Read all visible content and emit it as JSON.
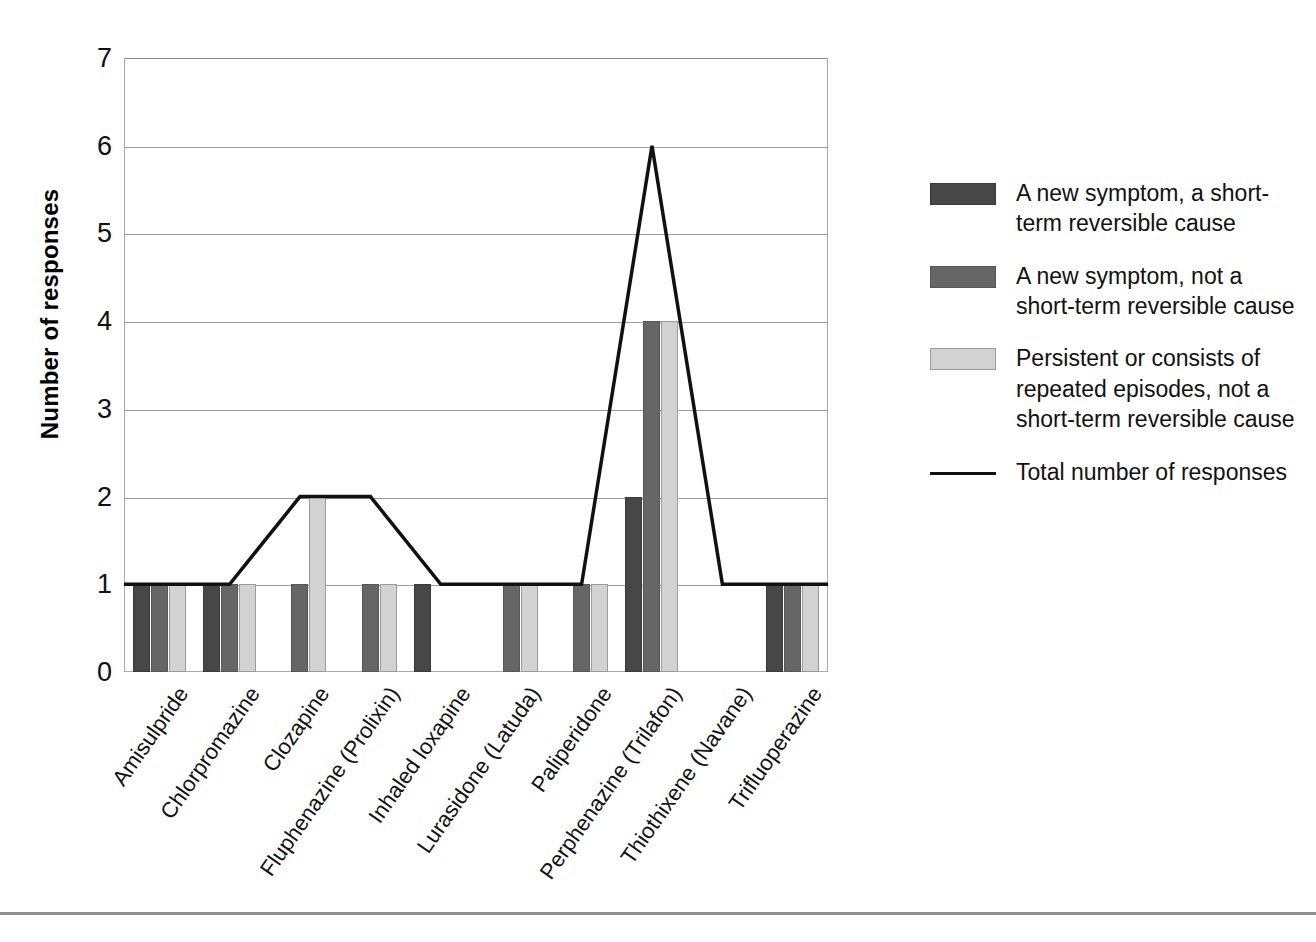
{
  "chart_data": {
    "type": "bar",
    "title": "",
    "xlabel": "",
    "ylabel": "Number of responses",
    "ylim": [
      0,
      7
    ],
    "yticks": [
      0,
      1,
      2,
      3,
      4,
      5,
      6,
      7
    ],
    "grid": true,
    "legend_position": "right",
    "categories": [
      "Amisulpride",
      "Chlorpromazine",
      "Clozapine",
      "Fluphenazine (Prolixin)",
      "Inhaled loxapine",
      "Lurasidone (Latuda)",
      "Paliperidone",
      "Perphenazine (Trilafon)",
      "Thiothixene (Navane)",
      "Trifluoperazine"
    ],
    "series": [
      {
        "name": "A new symptom, a short-term reversible cause",
        "type": "bar",
        "color": "#474747",
        "values": [
          1,
          1,
          0,
          0,
          1,
          0,
          0,
          2,
          0,
          1
        ]
      },
      {
        "name": "A new symptom, not a short-term reversible cause",
        "type": "bar",
        "color": "#666666",
        "values": [
          1,
          1,
          1,
          1,
          0,
          1,
          1,
          4,
          0,
          1
        ]
      },
      {
        "name": "Persistent or consists of repeated episodes, not a short-term reversible cause",
        "type": "bar",
        "color": "#d2d2d2",
        "values": [
          1,
          1,
          2,
          1,
          0,
          1,
          1,
          4,
          0,
          1
        ]
      },
      {
        "name": "Total number of responses",
        "type": "line",
        "color": "#111111",
        "values": [
          1,
          1,
          2,
          2,
          1,
          1,
          1,
          6,
          1,
          1
        ]
      }
    ]
  },
  "axes": {
    "y_title": "Number of responses",
    "y_ticks": [
      "7",
      "6",
      "5",
      "4",
      "3",
      "2",
      "1",
      "0"
    ],
    "x_labels": [
      "Amisulpride",
      "Chlorpromazine",
      "Clozapine",
      "Fluphenazine (Prolixin)",
      "Inhaled loxapine",
      "Lurasidone (Latuda)",
      "Paliperidone",
      "Perphenazine (Trilafon)",
      "Thiothixene (Navane)",
      "Trifluoperazine"
    ]
  },
  "legend": {
    "items": [
      {
        "kind": "swatch",
        "style": "s0",
        "label": "A new symptom, a short-term reversible cause"
      },
      {
        "kind": "swatch",
        "style": "s1",
        "label": "A new symptom, not a short-term reversible cause"
      },
      {
        "kind": "swatch",
        "style": "s2",
        "label": "Persistent or consists of repeated episodes, not a short-term reversible cause"
      },
      {
        "kind": "line",
        "style": "line",
        "label": "Total number of responses"
      }
    ]
  }
}
